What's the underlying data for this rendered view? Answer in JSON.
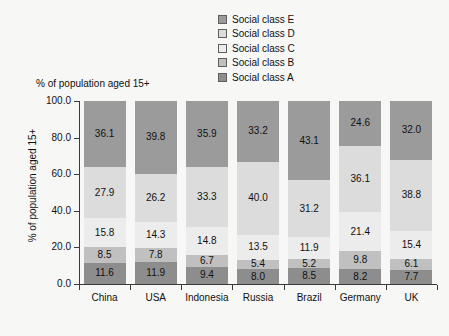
{
  "chart_data": {
    "type": "bar",
    "subtype": "stacked-100",
    "title": "% of population aged 15+",
    "xlabel": "",
    "ylabel": "% of population aged 15+",
    "ylim": [
      0,
      100
    ],
    "ytick_labels": [
      "100.0",
      "80.0",
      "60.0",
      "40.0",
      "20.0",
      "0.0"
    ],
    "ytick_values": [
      100,
      80,
      60,
      40,
      20,
      0
    ],
    "grid": false,
    "legend_position": "top-center",
    "categories": [
      "China",
      "USA",
      "Indonesia",
      "Russia",
      "Brazil",
      "Germany",
      "UK"
    ],
    "series": [
      {
        "name": "Social class A",
        "color": "#8d8d8d",
        "values": [
          11.6,
          11.9,
          9.4,
          8.0,
          8.5,
          8.2,
          7.7
        ]
      },
      {
        "name": "Social class B",
        "color": "#c0c0c0",
        "values": [
          8.5,
          7.8,
          6.7,
          5.4,
          5.2,
          9.8,
          6.1
        ]
      },
      {
        "name": "Social class C",
        "color": "#ececec",
        "values": [
          15.8,
          14.3,
          14.8,
          13.5,
          11.9,
          21.4,
          15.4
        ]
      },
      {
        "name": "Social class D",
        "color": "#dcdcdc",
        "values": [
          27.9,
          26.2,
          33.3,
          40.0,
          31.2,
          36.1,
          38.8
        ]
      },
      {
        "name": "Social class E",
        "color": "#9b9b9b",
        "values": [
          36.1,
          39.8,
          35.9,
          33.2,
          43.1,
          24.6,
          32.0
        ]
      }
    ]
  },
  "legend": {
    "items": [
      {
        "label": "Social class E",
        "color": "#9b9b9b"
      },
      {
        "label": "Social class D",
        "color": "#dcdcdc"
      },
      {
        "label": "Social class C",
        "color": "#ececec"
      },
      {
        "label": "Social class B",
        "color": "#c0c0c0"
      },
      {
        "label": "Social class A",
        "color": "#8d8d8d"
      }
    ]
  },
  "colors": {
    "background": "#f7f7f6",
    "axis": "#3a3a3a",
    "text": "#111111"
  }
}
